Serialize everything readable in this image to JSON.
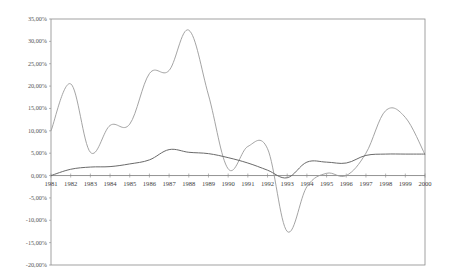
{
  "chart_data": {
    "type": "line",
    "title": "",
    "xlabel": "",
    "ylabel": "",
    "x": [
      1981,
      1982,
      1983,
      1984,
      1985,
      1986,
      1987,
      1988,
      1989,
      1990,
      1991,
      1992,
      1993,
      1994,
      1995,
      1996,
      1997,
      1998,
      1999,
      2000
    ],
    "x_tick_labels": [
      "1981",
      "1982",
      "1983",
      "1984",
      "1985",
      "1986",
      "1987",
      "1988",
      "1989",
      "1990",
      "1991",
      "1992",
      "1993",
      "1994",
      "1995",
      "1996",
      "1997",
      "1998",
      "1999",
      "2000"
    ],
    "ylim": [
      -20,
      35
    ],
    "y_ticks": [
      35,
      30,
      25,
      20,
      15,
      10,
      5,
      0,
      -5,
      -10,
      -15,
      -20
    ],
    "y_tick_labels": [
      "35,00%",
      "30,00%",
      "25,00%",
      "20,00%",
      "15,00%",
      "10,00%",
      "5,00%",
      "0,00%",
      "-5,00%",
      "-10,00%",
      "-15,00%",
      "-20,00%"
    ],
    "grid": false,
    "legend": null,
    "series": [
      {
        "name": "Series A (volatile)",
        "color": "#9a9a9a",
        "values": [
          10.0,
          20.5,
          5.2,
          11.2,
          11.5,
          22.8,
          23.5,
          32.5,
          18.0,
          1.5,
          6.5,
          6.0,
          -12.5,
          -2.5,
          0.5,
          0.0,
          5.0,
          14.5,
          13.0,
          4.7
        ]
      },
      {
        "name": "Series B (smooth)",
        "color": "#6a6a6a",
        "values": [
          0.0,
          1.4,
          1.9,
          2.0,
          2.6,
          3.5,
          5.8,
          5.2,
          4.9,
          4.0,
          2.8,
          1.2,
          -0.5,
          3.0,
          3.0,
          2.8,
          4.5,
          4.8,
          4.8,
          4.8
        ]
      }
    ]
  }
}
